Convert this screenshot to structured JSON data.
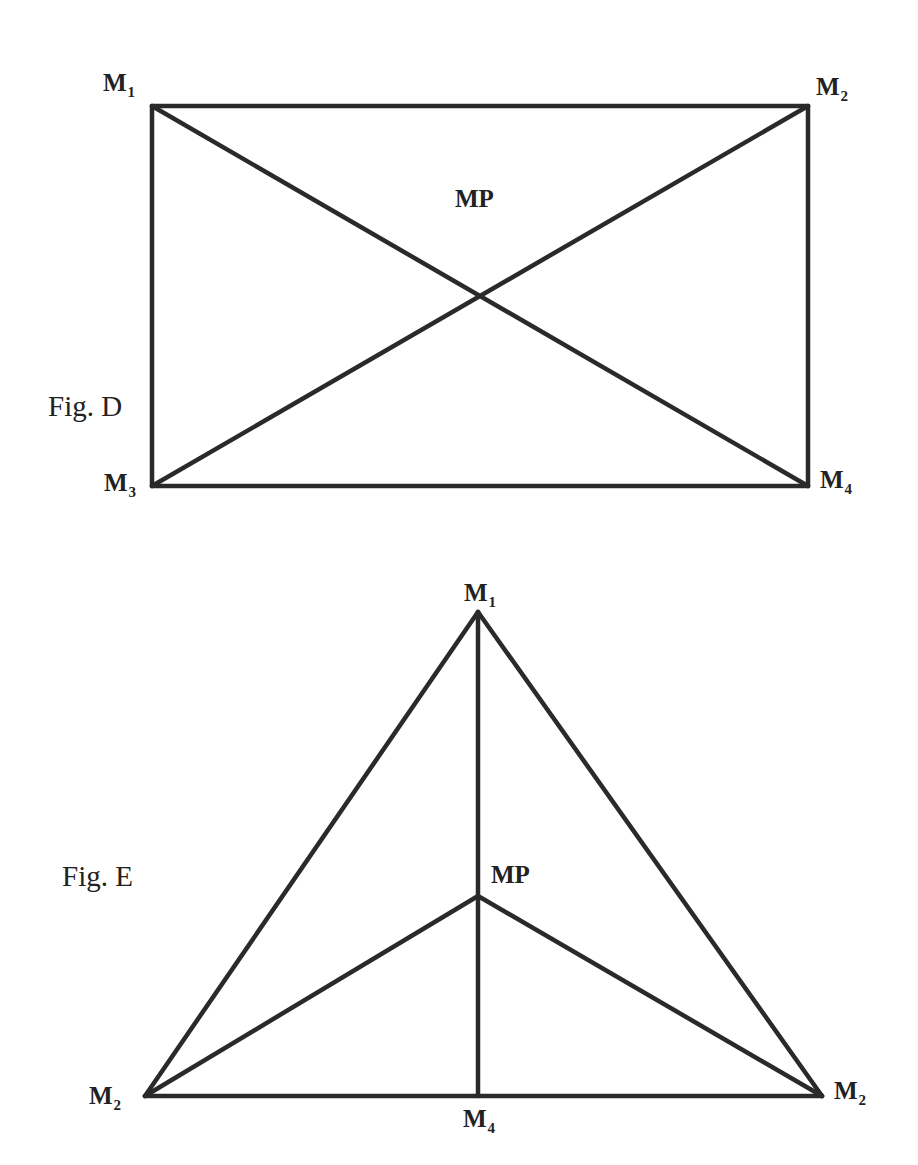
{
  "figures": [
    {
      "id": "fig_d",
      "caption": "Fig. D",
      "shape": "rectangle with both diagonals",
      "labels": {
        "m1": {
          "main": "M",
          "sub": "1"
        },
        "m2": {
          "main": "M",
          "sub": "2"
        },
        "m3": {
          "main": "M",
          "sub": "3"
        },
        "m4": {
          "main": "M",
          "sub": "4"
        },
        "mp": {
          "main": "MP"
        }
      },
      "vertices": {
        "M1": [
          152,
          106
        ],
        "M2": [
          808,
          106
        ],
        "M3": [
          152,
          486
        ],
        "M4": [
          808,
          486
        ],
        "MP": [
          481,
          296
        ]
      },
      "edges": [
        [
          "M1",
          "M2"
        ],
        [
          "M2",
          "M4"
        ],
        [
          "M4",
          "M3"
        ],
        [
          "M3",
          "M1"
        ],
        [
          "M1",
          "M4"
        ],
        [
          "M2",
          "M3"
        ]
      ]
    },
    {
      "id": "fig_e",
      "caption": "Fig. E",
      "shape": "triangle with center point connected to vertices and vertical median",
      "labels": {
        "apex": {
          "main": "M",
          "sub": "1"
        },
        "base_left": {
          "main": "M",
          "sub": "2"
        },
        "base_mid": {
          "main": "M",
          "sub": "4"
        },
        "base_right": {
          "main": "M",
          "sub": "2"
        },
        "mp": {
          "main": "MP"
        }
      },
      "vertices": {
        "apex": [
          478,
          612
        ],
        "base_left": [
          145,
          1096
        ],
        "base_right": [
          822,
          1096
        ],
        "base_mid": [
          478,
          1096
        ],
        "MP": [
          478,
          896
        ]
      },
      "edges": [
        [
          "apex",
          "base_left"
        ],
        [
          "apex",
          "base_right"
        ],
        [
          "base_left",
          "base_right"
        ],
        [
          "apex",
          "base_mid"
        ],
        [
          "MP",
          "base_left"
        ],
        [
          "MP",
          "base_right"
        ]
      ]
    }
  ],
  "style": {
    "line_color": "#2a2a2a",
    "text_color": "#222222",
    "background": "#ffffff"
  }
}
